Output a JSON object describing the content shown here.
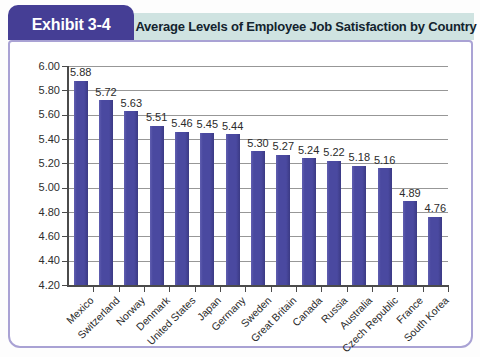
{
  "header": {
    "exhibit_label": "Exhibit 3-4",
    "title": "Average Levels of Employee Job Satisfaction by Country"
  },
  "colors": {
    "tab_background": "#453e95",
    "tab_text": "#ffffff",
    "titlebar_background": "#cfe3e1",
    "title_text": "#13232e",
    "panel_border": "#a9a2d4",
    "bar_fill": "#4a49a0",
    "bar_shadow_edge": "#3b3a84",
    "gridline": "#979797",
    "axis": "#4b4b4b",
    "label_text": "#2b2b2b"
  },
  "chart_data": {
    "type": "bar",
    "title": "Average Levels of Employee Job Satisfaction by Country",
    "categories": [
      "Mexico",
      "Switzerland",
      "Norway",
      "Denmark",
      "United States",
      "Japan",
      "Germany",
      "Sweden",
      "Great Britain",
      "Canada",
      "Russia",
      "Australia",
      "Czech Republic",
      "France",
      "South Korea"
    ],
    "values": [
      5.88,
      5.72,
      5.63,
      5.51,
      5.46,
      5.45,
      5.44,
      5.3,
      5.27,
      5.24,
      5.22,
      5.18,
      5.16,
      4.89,
      4.76
    ],
    "value_labels": [
      "5.88",
      "5.72",
      "5.63",
      "5.51",
      "5.46",
      "5.45",
      "5.44",
      "5.30",
      "5.27",
      "5.24",
      "5.22",
      "5.18",
      "5.16",
      "4.89",
      "4.76"
    ],
    "xlabel": "",
    "ylabel": "",
    "ylim": [
      4.2,
      6.0
    ],
    "ytick_step": 0.2,
    "yticks": [
      "6.00",
      "5.80",
      "5.60",
      "5.40",
      "5.20",
      "5.00",
      "4.80",
      "4.60",
      "4.40",
      "4.20"
    ],
    "grid": true,
    "legend": false
  }
}
